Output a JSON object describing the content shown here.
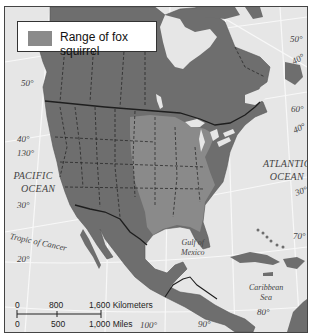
{
  "legend": {
    "label": "Range of fox squirrel",
    "swatch_color": "#8a8a8a"
  },
  "colors": {
    "water": "#e6e6e6",
    "land": "#6e6e6e",
    "range": "#8a8a8a",
    "graticule": "#f8f8f8",
    "border": "#1e1e1e"
  },
  "oceans": {
    "pacific": [
      "PACIFIC",
      "OCEAN"
    ],
    "atlantic": [
      "ATLANTIC",
      "OCEAN"
    ],
    "gulf": [
      "Gulf of",
      "Mexico"
    ],
    "caribbean": [
      "Caribbean",
      "Sea"
    ]
  },
  "lines": {
    "tropic": "Tropic of Cancer"
  },
  "graticule_labels": {
    "lat_50_west": "50°",
    "lat_40_west": "40°",
    "lon_130": "130°",
    "lat_30_west": "30°",
    "lat_20_west": "20°",
    "lat_50_east": "50°",
    "lat_40_east": "40°",
    "lon_60": "60°",
    "lat_30_east": "30°",
    "lon_70": "70°",
    "lon_80": "80°",
    "lon_90": "90°",
    "lon_100": "100°"
  },
  "scale_bar": {
    "km_ticks": [
      "0",
      "800",
      "1,600 Kilometers"
    ],
    "mi_ticks": [
      "0",
      "500",
      "1,000 Miles"
    ]
  }
}
